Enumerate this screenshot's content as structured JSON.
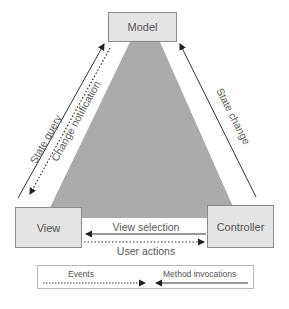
{
  "diagram": {
    "nodes": {
      "model": "Model",
      "view": "View",
      "controller": "Controller"
    },
    "edges": {
      "state_query": "State query",
      "change_notification": "Change notification",
      "state_change": "State change",
      "view_selection": "View selection",
      "user_actions": "User actions"
    },
    "legend": {
      "events": "Events",
      "method_invocations": "Method invocations"
    },
    "colors": {
      "triangle_fill": "#a9a9a9",
      "box_fill": "#e4e4e4",
      "box_border": "#8a8a8a",
      "line": "#333333"
    }
  }
}
